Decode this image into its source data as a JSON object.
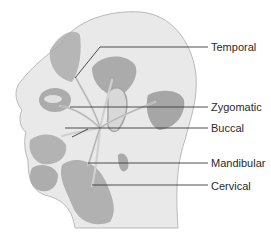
{
  "colors": {
    "skin": "#e9e9e9",
    "outline": "#b9b9b9",
    "muscle": "#a9a9a9",
    "muscle_dark": "#8f8f8f",
    "nerve": "#d4d4d4",
    "leader_line": "#3a3a3a",
    "text": "#2a2a2a"
  },
  "labels": [
    {
      "id": "temporal",
      "text": "Temporal",
      "y": 41,
      "line_y": 47
    },
    {
      "id": "zygomatic",
      "text": "Zygomatic",
      "y": 101,
      "line_y": 107
    },
    {
      "id": "buccal",
      "text": "Buccal",
      "y": 122,
      "line_y": 128
    },
    {
      "id": "mandibular",
      "text": "Mandibular",
      "y": 157,
      "line_y": 163
    },
    {
      "id": "cervical",
      "text": "Cervical",
      "y": 180,
      "line_y": 185
    }
  ]
}
